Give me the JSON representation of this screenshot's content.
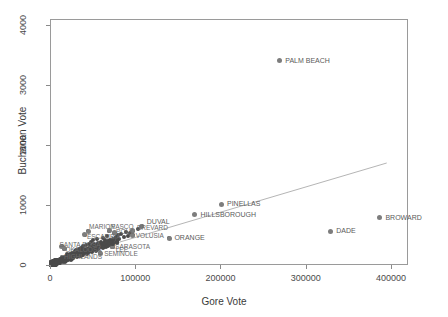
{
  "chart_data": {
    "type": "scatter",
    "title": "",
    "xlabel": "Gore Vote",
    "ylabel": "Buchanan Vote",
    "xlim": [
      0,
      420000
    ],
    "ylim": [
      0,
      4100
    ],
    "xticks": [
      0,
      100000,
      200000,
      300000,
      400000
    ],
    "xtick_labels": [
      "0",
      "100000",
      "200000",
      "300000",
      "400000"
    ],
    "yticks": [
      0,
      1000,
      2000,
      3000,
      4000
    ],
    "ytick_labels": [
      "0",
      "1000",
      "2000",
      "3000",
      "4000"
    ],
    "grid": false,
    "legend": null,
    "point_color": "#7d7d7d",
    "line_color": "#b5b5b5",
    "regression_line": {
      "x": [
        4000,
        395000
      ],
      "y": [
        55,
        1700
      ]
    },
    "labeled_points": [
      {
        "label": "PALM BEACH",
        "x": 268945,
        "y": 3407
      },
      {
        "label": "PINELLAS",
        "x": 200630,
        "y": 1010
      },
      {
        "label": "HILLSBOROUGH",
        "x": 169529,
        "y": 836
      },
      {
        "label": "BROWARD",
        "x": 386518,
        "y": 789
      },
      {
        "label": "DADE",
        "x": 328702,
        "y": 561
      },
      {
        "label": "DUVAL",
        "x": 107680,
        "y": 650
      },
      {
        "label": "ORANGE",
        "x": 140115,
        "y": 446
      },
      {
        "label": "BREVARD",
        "x": 97318,
        "y": 570
      },
      {
        "label": "VOLUSIA",
        "x": 97063,
        "y": 496
      },
      {
        "label": "ESCAMBIA",
        "x": 40943,
        "y": 504
      },
      {
        "label": "MARION",
        "x": 44648,
        "y": 563
      },
      {
        "label": "PASCO",
        "x": 69564,
        "y": 570
      },
      {
        "label": "POLK",
        "x": 75200,
        "y": 538
      },
      {
        "label": "SANTA ROSA",
        "x": 13518,
        "y": 312
      },
      {
        "label": "SARASOTA",
        "x": 72854,
        "y": 305
      },
      {
        "label": "SEMINOLE",
        "x": 58888,
        "y": 194
      },
      {
        "label": "LEE",
        "x": 73560,
        "y": 305
      },
      {
        "label": "HIGHLANDS",
        "x": 14152,
        "y": 127
      },
      {
        "label": "OKALOOSA",
        "x": 16948,
        "y": 267
      }
    ],
    "unlabeled_points_note": "dense cluster of remaining Florida counties near the origin",
    "cluster_points": [
      {
        "x": 2392,
        "y": 9
      },
      {
        "x": 3072,
        "y": 29
      },
      {
        "x": 4998,
        "y": 22
      },
      {
        "x": 5643,
        "y": 39
      },
      {
        "x": 6443,
        "y": 78
      },
      {
        "x": 7420,
        "y": 45
      },
      {
        "x": 8072,
        "y": 86
      },
      {
        "x": 9158,
        "y": 36
      },
      {
        "x": 10395,
        "y": 54
      },
      {
        "x": 11442,
        "y": 57
      },
      {
        "x": 12116,
        "y": 41
      },
      {
        "x": 13518,
        "y": 312
      },
      {
        "x": 14152,
        "y": 127
      },
      {
        "x": 14728,
        "y": 73
      },
      {
        "x": 16101,
        "y": 83
      },
      {
        "x": 16948,
        "y": 267
      },
      {
        "x": 17833,
        "y": 120
      },
      {
        "x": 18850,
        "y": 95
      },
      {
        "x": 19769,
        "y": 180
      },
      {
        "x": 20196,
        "y": 145
      },
      {
        "x": 21666,
        "y": 107
      },
      {
        "x": 22871,
        "y": 160
      },
      {
        "x": 23983,
        "y": 182
      },
      {
        "x": 24864,
        "y": 141
      },
      {
        "x": 25501,
        "y": 208
      },
      {
        "x": 26619,
        "y": 124
      },
      {
        "x": 27774,
        "y": 196
      },
      {
        "x": 28810,
        "y": 233
      },
      {
        "x": 29645,
        "y": 152
      },
      {
        "x": 30912,
        "y": 251
      },
      {
        "x": 31826,
        "y": 188
      },
      {
        "x": 33133,
        "y": 220
      },
      {
        "x": 34150,
        "y": 265
      },
      {
        "x": 35100,
        "y": 198
      },
      {
        "x": 36530,
        "y": 290
      },
      {
        "x": 37500,
        "y": 240
      },
      {
        "x": 38750,
        "y": 310
      },
      {
        "x": 39820,
        "y": 262
      },
      {
        "x": 40943,
        "y": 504
      },
      {
        "x": 41900,
        "y": 330
      },
      {
        "x": 43110,
        "y": 275
      },
      {
        "x": 44648,
        "y": 563
      },
      {
        "x": 45330,
        "y": 350
      },
      {
        "x": 46700,
        "y": 297
      },
      {
        "x": 47980,
        "y": 385
      },
      {
        "x": 49120,
        "y": 318
      },
      {
        "x": 50500,
        "y": 410
      },
      {
        "x": 51880,
        "y": 345
      },
      {
        "x": 53200,
        "y": 280
      },
      {
        "x": 54600,
        "y": 430
      },
      {
        "x": 56100,
        "y": 360
      },
      {
        "x": 57400,
        "y": 300
      },
      {
        "x": 58888,
        "y": 194
      },
      {
        "x": 60200,
        "y": 390
      },
      {
        "x": 61700,
        "y": 455
      },
      {
        "x": 63100,
        "y": 340
      },
      {
        "x": 64500,
        "y": 420
      },
      {
        "x": 66000,
        "y": 370
      },
      {
        "x": 67400,
        "y": 480
      },
      {
        "x": 69564,
        "y": 570
      },
      {
        "x": 70800,
        "y": 410
      },
      {
        "x": 72854,
        "y": 305
      },
      {
        "x": 73560,
        "y": 305
      },
      {
        "x": 75200,
        "y": 538
      },
      {
        "x": 77000,
        "y": 460
      },
      {
        "x": 79500,
        "y": 505
      },
      {
        "x": 81200,
        "y": 430
      },
      {
        "x": 83800,
        "y": 520
      },
      {
        "x": 86400,
        "y": 470
      },
      {
        "x": 88900,
        "y": 545
      },
      {
        "x": 91500,
        "y": 490
      },
      {
        "x": 94200,
        "y": 530
      },
      {
        "x": 97063,
        "y": 496
      },
      {
        "x": 97318,
        "y": 570
      },
      {
        "x": 103000,
        "y": 600
      },
      {
        "x": 107680,
        "y": 650
      },
      {
        "x": 140115,
        "y": 446
      }
    ]
  },
  "axes": {
    "xlabel": "Gore Vote",
    "ylabel": "Buchanan Vote"
  }
}
